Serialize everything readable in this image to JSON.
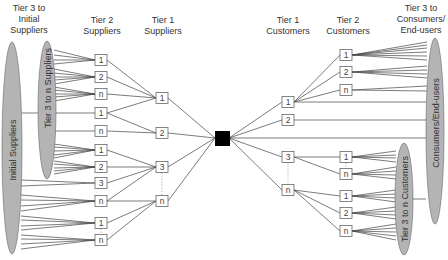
{
  "headers": {
    "tier3_initial_suppliers": "Tier 3 to\nInitial\nSuppliers",
    "tier2_suppliers": "Tier 2\nSuppliers",
    "tier1_suppliers": "Tier 1\nSuppliers",
    "tier1_customers": "Tier 1\nCustomers",
    "tier2_customers": "Tier 2\nCustomers",
    "tier3_consumers": "Tier 3 to\nConsumers/\nEnd-users"
  },
  "ellipses": {
    "initial_suppliers": "Initial Suppliers",
    "tier3_n_suppliers": "Tier 3 to n Suppliers",
    "consumers_end_users": "Consumers/End-users",
    "tier3_n_customers": "Tier 3 to n Customers"
  },
  "colors": {
    "ellipse_fill": "#b4b4b4",
    "line": "#444444",
    "box_border": "#666666",
    "focal": "#000000",
    "dotted": "#aaaaaa"
  },
  "nodes": {
    "tier2_suppliers": [
      {
        "label": "1",
        "y": 60
      },
      {
        "label": "2",
        "y": 77
      },
      {
        "label": "n",
        "y": 94
      },
      {
        "label": "1",
        "y": 113
      },
      {
        "label": "n",
        "y": 131
      },
      {
        "label": "1",
        "y": 150
      },
      {
        "label": "2",
        "y": 167
      },
      {
        "label": "3",
        "y": 183
      },
      {
        "label": "n",
        "y": 201
      },
      {
        "label": "1",
        "y": 223
      },
      {
        "label": "n",
        "y": 240
      }
    ],
    "tier1_suppliers": [
      {
        "label": "1",
        "y": 98
      },
      {
        "label": "2",
        "y": 133
      },
      {
        "label": "3",
        "y": 167
      },
      {
        "label": "n",
        "y": 201
      }
    ],
    "tier1_customers": [
      {
        "label": "1",
        "y": 102
      },
      {
        "label": "2",
        "y": 120
      },
      {
        "label": "3",
        "y": 157
      },
      {
        "label": "n",
        "y": 190
      }
    ],
    "tier2_customers": [
      {
        "label": "1",
        "y": 55
      },
      {
        "label": "2",
        "y": 72
      },
      {
        "label": "n",
        "y": 90
      },
      {
        "label": "1",
        "y": 157
      },
      {
        "label": "n",
        "y": 174
      },
      {
        "label": "1",
        "y": 196
      },
      {
        "label": "2",
        "y": 213
      },
      {
        "label": "n",
        "y": 231
      }
    ]
  },
  "focal_company": {
    "x": 222,
    "y": 138
  }
}
